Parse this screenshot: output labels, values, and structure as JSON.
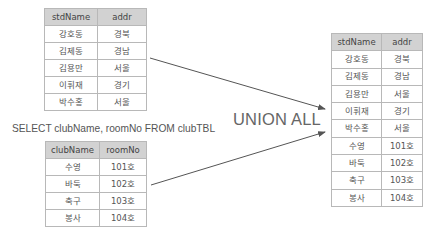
{
  "std_table": {
    "headers": [
      "stdName",
      "addr"
    ],
    "rows": [
      [
        "강호동",
        "경북"
      ],
      [
        "김제동",
        "경남"
      ],
      [
        "김용만",
        "서울"
      ],
      [
        "이휘재",
        "경기"
      ],
      [
        "박수홍",
        "서울"
      ]
    ]
  },
  "query": {
    "text": "SELECT clubName, roomNo FROM clubTBL"
  },
  "club_table": {
    "headers": [
      "clubName",
      "roomNo"
    ],
    "rows": [
      [
        "수영",
        "101호"
      ],
      [
        "바둑",
        "102호"
      ],
      [
        "축구",
        "103호"
      ],
      [
        "봉사",
        "104호"
      ]
    ]
  },
  "operator": {
    "label": "UNION ALL"
  },
  "result_table": {
    "headers": [
      "stdName",
      "addr"
    ],
    "rows": [
      [
        "강호동",
        "경북"
      ],
      [
        "김제동",
        "경남"
      ],
      [
        "김용만",
        "서울"
      ],
      [
        "이휘재",
        "경기"
      ],
      [
        "박수홍",
        "서울"
      ],
      [
        "수영",
        "101호"
      ],
      [
        "바둑",
        "102호"
      ],
      [
        "축구",
        "103호"
      ],
      [
        "봉사",
        "104호"
      ]
    ]
  },
  "colors": {
    "header_bg": "#d2d2d2",
    "border": "#b8b8b8",
    "arrow": "#555555"
  }
}
